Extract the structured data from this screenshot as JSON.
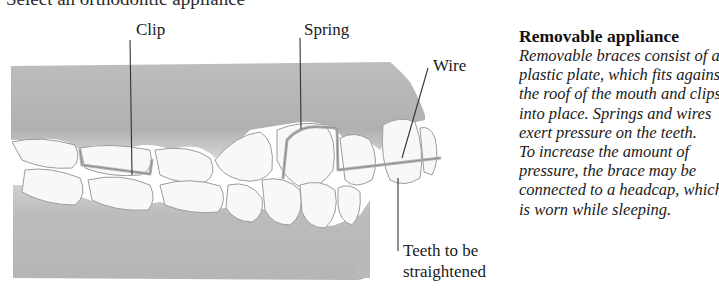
{
  "header": {
    "cut_heading": "Select an orthodontic appliance"
  },
  "figure": {
    "labels": {
      "clip": "Clip",
      "spring": "Spring",
      "wire": "Wire",
      "teeth_line1": "Teeth to be",
      "teeth_line2": "straightened"
    },
    "colors": {
      "gum": "#b8b8b8",
      "gum_dark": "#9e9e9e",
      "tooth": "#f7f7f7",
      "tooth_outline": "#9a9a9a",
      "leader_line": "#333333"
    }
  },
  "sidebar": {
    "title": "Removable appliance",
    "lines": [
      "Removable braces consist of a",
      "plastic plate, which fits against",
      "the roof of the mouth and clips",
      "into place. Springs and wires",
      "exert pressure on the teeth.",
      "To increase the amount of",
      "pressure, the brace may be",
      "connected to a headcap, which",
      "is worn while sleeping."
    ]
  }
}
